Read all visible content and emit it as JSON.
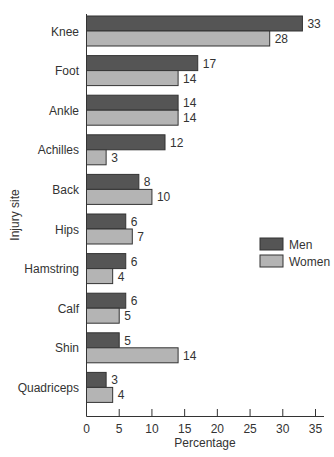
{
  "chart_data": {
    "type": "bar",
    "orientation": "horizontal",
    "title": "",
    "xlabel": "Percentage",
    "ylabel": "Injury site",
    "xlim": [
      0,
      35
    ],
    "xticks": [
      0,
      5,
      10,
      15,
      20,
      25,
      30,
      35
    ],
    "grid": false,
    "legend_position": "right-middle",
    "categories": [
      "Knee",
      "Foot",
      "Ankle",
      "Achilles",
      "Back",
      "Hips",
      "Hamstring",
      "Calf",
      "Shin",
      "Quadriceps"
    ],
    "series": [
      {
        "name": "Men",
        "color": "#555555",
        "values": [
          33,
          17,
          14,
          12,
          8,
          6,
          6,
          6,
          5,
          3
        ]
      },
      {
        "name": "Women",
        "color": "#b4b4b4",
        "values": [
          28,
          14,
          14,
          3,
          10,
          7,
          4,
          5,
          14,
          4
        ]
      }
    ]
  }
}
